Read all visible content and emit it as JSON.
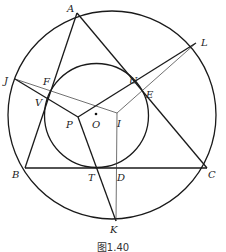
{
  "figure": {
    "caption": "图1.40",
    "circumcircle": {
      "cx": 112,
      "cy": 115,
      "r": 104
    },
    "incircle": {
      "cx": 96.5,
      "cy": 115.5,
      "r": 52
    },
    "center_dot": {
      "x": 96,
      "y": 116
    },
    "points": {
      "A": {
        "label": "A",
        "x": 77,
        "y": 13
      },
      "B": {
        "label": "B",
        "x": 25,
        "y": 168
      },
      "C": {
        "label": "C",
        "x": 207,
        "y": 168
      },
      "L": {
        "label": "L",
        "x": 196,
        "y": 43
      },
      "J": {
        "label": "J",
        "x": 15,
        "y": 79
      },
      "K": {
        "label": "K",
        "x": 116,
        "y": 221
      },
      "U": {
        "label": "U",
        "x": 135,
        "y": 81
      },
      "E": {
        "label": "E",
        "x": 142,
        "y": 89
      },
      "F": {
        "label": "F",
        "x": 52,
        "y": 88
      },
      "V": {
        "label": "V",
        "x": 47,
        "y": 99
      },
      "P": {
        "label": "P",
        "x": 78,
        "y": 117
      },
      "O": {
        "label": "O",
        "x": 96,
        "y": 116
      },
      "I": {
        "label": "I",
        "x": 117,
        "y": 113
      },
      "T": {
        "label": "T",
        "x": 101,
        "y": 169
      },
      "D": {
        "label": "D",
        "x": 117,
        "y": 169
      }
    },
    "label_text": {
      "A": "A",
      "B": "B",
      "C": "C",
      "L": "L",
      "J": "J",
      "K": "K",
      "U": "U",
      "E": "E",
      "F": "F",
      "V": "V",
      "P": "P",
      "O": "O",
      "I": "I",
      "T": "T",
      "D": "D"
    }
  }
}
